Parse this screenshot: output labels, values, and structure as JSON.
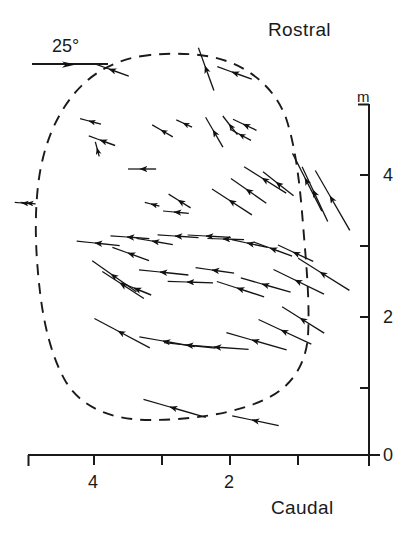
{
  "figure": {
    "type": "vector-field-map",
    "orientation_labels": {
      "top": "Rostral",
      "bottom": "Caudal"
    },
    "scale_bar": {
      "label": "25°",
      "icon": "right-arrow-icon"
    },
    "y_axis": {
      "unit_label": "m",
      "ticks": [
        0,
        1,
        2,
        3,
        4,
        5
      ],
      "labeled": [
        "0",
        "2",
        "4"
      ],
      "range": [
        0,
        5
      ]
    },
    "x_axis": {
      "ticks": [
        0,
        1,
        2,
        3,
        4,
        5
      ],
      "labeled": [
        "2",
        "4"
      ],
      "range": [
        0,
        5
      ]
    },
    "outline": {
      "style": "dashed",
      "name": "region-boundary"
    }
  },
  "chart_data": {
    "type": "scatter",
    "title": "",
    "xlabel": "",
    "ylabel": "",
    "xlim": [
      0,
      5.2
    ],
    "ylim": [
      0,
      5.2
    ],
    "grid": false,
    "legend": "none",
    "annotations": [
      "Rostral",
      "Caudal",
      "25°",
      "m"
    ],
    "xticks": [
      0,
      1,
      2,
      3,
      4,
      5
    ],
    "xticklabels": [
      "",
      "",
      "2",
      "",
      "4",
      ""
    ],
    "yticks": [
      0,
      1,
      2,
      3,
      4,
      5
    ],
    "yticklabels": [
      "0",
      "",
      "2",
      "",
      "4",
      ""
    ],
    "scale_bar_deg": 25,
    "scale_bar_length_mm": 1.25,
    "boundary_outline_px": "M 150,55 C 118,58 92,72 74,94 C 54,118 42,150 38,186 C 34,222 36,258 40,292 C 44,326 52,358 66,382 C 82,408 112,420 150,420 C 190,420 236,414 268,398 C 292,386 306,364 308,336 C 310,300 306,262 303,224 C 300,186 296,148 286,118 C 274,86 246,64 212,57 C 192,53 170,53 150,55 Z",
    "vectors_note": "Each datum: arrowhead marks the recording site; the line through it shows preferred axis/direction; line length encodes magnitude (25° scale bar).",
    "vectors": [
      {
        "x_px": 22,
        "y_px": 203,
        "angle_deg": 185,
        "len_px": 16
      },
      {
        "x_px": 109,
        "y_px": 69,
        "angle_deg": 200,
        "len_px": 34
      },
      {
        "x_px": 205,
        "y_px": 66,
        "angle_deg": 250,
        "len_px": 42
      },
      {
        "x_px": 232,
        "y_px": 72,
        "angle_deg": 200,
        "len_px": 34
      },
      {
        "x_px": 89,
        "y_px": 121,
        "angle_deg": 195,
        "len_px": 20
      },
      {
        "x_px": 100,
        "y_px": 140,
        "angle_deg": 200,
        "len_px": 26
      },
      {
        "x_px": 97,
        "y_px": 148,
        "angle_deg": 255,
        "len_px": 14
      },
      {
        "x_px": 161,
        "y_px": 130,
        "angle_deg": 210,
        "len_px": 22
      },
      {
        "x_px": 183,
        "y_px": 123,
        "angle_deg": 205,
        "len_px": 16
      },
      {
        "x_px": 213,
        "y_px": 130,
        "angle_deg": 240,
        "len_px": 32
      },
      {
        "x_px": 229,
        "y_px": 124,
        "angle_deg": 232,
        "len_px": 22
      },
      {
        "x_px": 243,
        "y_px": 124,
        "angle_deg": 205,
        "len_px": 24
      },
      {
        "x_px": 239,
        "y_px": 134,
        "angle_deg": 208,
        "len_px": 22
      },
      {
        "x_px": 140,
        "y_px": 169,
        "angle_deg": 180,
        "len_px": 26
      },
      {
        "x_px": 27,
        "y_px": 203,
        "angle_deg": 185,
        "len_px": 14
      },
      {
        "x_px": 151,
        "y_px": 204,
        "angle_deg": 195,
        "len_px": 14
      },
      {
        "x_px": 178,
        "y_px": 200,
        "angle_deg": 212,
        "len_px": 24
      },
      {
        "x_px": 174,
        "y_px": 212,
        "angle_deg": 185,
        "len_px": 24
      },
      {
        "x_px": 229,
        "y_px": 200,
        "angle_deg": 213,
        "len_px": 44
      },
      {
        "x_px": 246,
        "y_px": 189,
        "angle_deg": 215,
        "len_px": 40
      },
      {
        "x_px": 262,
        "y_px": 178,
        "angle_deg": 212,
        "len_px": 46
      },
      {
        "x_px": 276,
        "y_px": 182,
        "angle_deg": 218,
        "len_px": 36
      },
      {
        "x_px": 305,
        "y_px": 178,
        "angle_deg": 243,
        "len_px": 60
      },
      {
        "x_px": 313,
        "y_px": 190,
        "angle_deg": 245,
        "len_px": 56
      },
      {
        "x_px": 330,
        "y_px": 196,
        "angle_deg": 240,
        "len_px": 64
      },
      {
        "x_px": 95,
        "y_px": 243,
        "angle_deg": 186,
        "len_px": 40
      },
      {
        "x_px": 127,
        "y_px": 237,
        "angle_deg": 184,
        "len_px": 36
      },
      {
        "x_px": 152,
        "y_px": 241,
        "angle_deg": 190,
        "len_px": 34
      },
      {
        "x_px": 128,
        "y_px": 253,
        "angle_deg": 200,
        "len_px": 36
      },
      {
        "x_px": 175,
        "y_px": 236,
        "angle_deg": 184,
        "len_px": 38
      },
      {
        "x_px": 206,
        "y_px": 236,
        "angle_deg": 183,
        "len_px": 40
      },
      {
        "x_px": 223,
        "y_px": 239,
        "angle_deg": 182,
        "len_px": 34
      },
      {
        "x_px": 247,
        "y_px": 243,
        "angle_deg": 192,
        "len_px": 34
      },
      {
        "x_px": 270,
        "y_px": 248,
        "angle_deg": 200,
        "len_px": 38
      },
      {
        "x_px": 293,
        "y_px": 252,
        "angle_deg": 205,
        "len_px": 36
      },
      {
        "x_px": 111,
        "y_px": 274,
        "angle_deg": 215,
        "len_px": 50
      },
      {
        "x_px": 120,
        "y_px": 283,
        "angle_deg": 213,
        "len_px": 46
      },
      {
        "x_px": 134,
        "y_px": 288,
        "angle_deg": 202,
        "len_px": 30
      },
      {
        "x_px": 160,
        "y_px": 272,
        "angle_deg": 186,
        "len_px": 46
      },
      {
        "x_px": 187,
        "y_px": 282,
        "angle_deg": 182,
        "len_px": 42
      },
      {
        "x_px": 212,
        "y_px": 270,
        "angle_deg": 188,
        "len_px": 36
      },
      {
        "x_px": 237,
        "y_px": 288,
        "angle_deg": 198,
        "len_px": 46
      },
      {
        "x_px": 262,
        "y_px": 284,
        "angle_deg": 196,
        "len_px": 48
      },
      {
        "x_px": 295,
        "y_px": 280,
        "angle_deg": 206,
        "len_px": 52
      },
      {
        "x_px": 320,
        "y_px": 272,
        "angle_deg": 212,
        "len_px": 56
      },
      {
        "x_px": 118,
        "y_px": 331,
        "angle_deg": 208,
        "len_px": 58
      },
      {
        "x_px": 163,
        "y_px": 341,
        "angle_deg": 190,
        "len_px": 52
      },
      {
        "x_px": 186,
        "y_px": 345,
        "angle_deg": 186,
        "len_px": 48
      },
      {
        "x_px": 214,
        "y_px": 347,
        "angle_deg": 184,
        "len_px": 56
      },
      {
        "x_px": 252,
        "y_px": 340,
        "angle_deg": 196,
        "len_px": 58
      },
      {
        "x_px": 281,
        "y_px": 330,
        "angle_deg": 205,
        "len_px": 54
      },
      {
        "x_px": 300,
        "y_px": 318,
        "angle_deg": 212,
        "len_px": 46
      },
      {
        "x_px": 170,
        "y_px": 407,
        "angle_deg": 196,
        "len_px": 60
      },
      {
        "x_px": 252,
        "y_px": 420,
        "angle_deg": 192,
        "len_px": 44
      }
    ]
  }
}
